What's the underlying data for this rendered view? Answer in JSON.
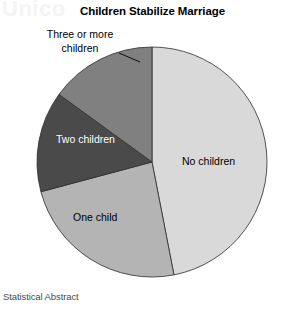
{
  "chart_data": {
    "type": "pie",
    "title": "Children Stabilize Marriage",
    "source": "Statistical Abstract",
    "watermark": "Unico",
    "categories": [
      "No children",
      "One child",
      "Two children",
      "Three or more children"
    ],
    "values": [
      47,
      24,
      14,
      15
    ],
    "unit": "percent",
    "start_angle_deg": 0,
    "direction": "clockwise",
    "legend": "none",
    "grid": false,
    "slices": [
      {
        "label": "No children",
        "value": 47,
        "color": "#d9d9d9",
        "start_deg": 0,
        "end_deg": 169,
        "label_placement": "inside",
        "label_color": "#000000"
      },
      {
        "label": "One child",
        "value": 24,
        "color": "#b4b4b4",
        "start_deg": 169,
        "end_deg": 255,
        "label_placement": "inside",
        "label_color": "#000000"
      },
      {
        "label": "Two children",
        "value": 14,
        "color": "#4a4a4a",
        "start_deg": 255,
        "end_deg": 306,
        "label_placement": "inside",
        "label_color": "#ffffff"
      },
      {
        "label": "Three or more children",
        "value": 15,
        "color": "#808080",
        "start_deg": 306,
        "end_deg": 360,
        "label_placement": "outside",
        "label_color": "#000000",
        "leader_line": true
      }
    ],
    "geometry": {
      "center_x": 152,
      "center_y": 162,
      "radius": 115
    }
  },
  "labels": {
    "three_or_more_line1": "Three or more",
    "three_or_more_line2": "children",
    "no_children": "No children",
    "one_child": "One child",
    "two_children": "Two children"
  }
}
